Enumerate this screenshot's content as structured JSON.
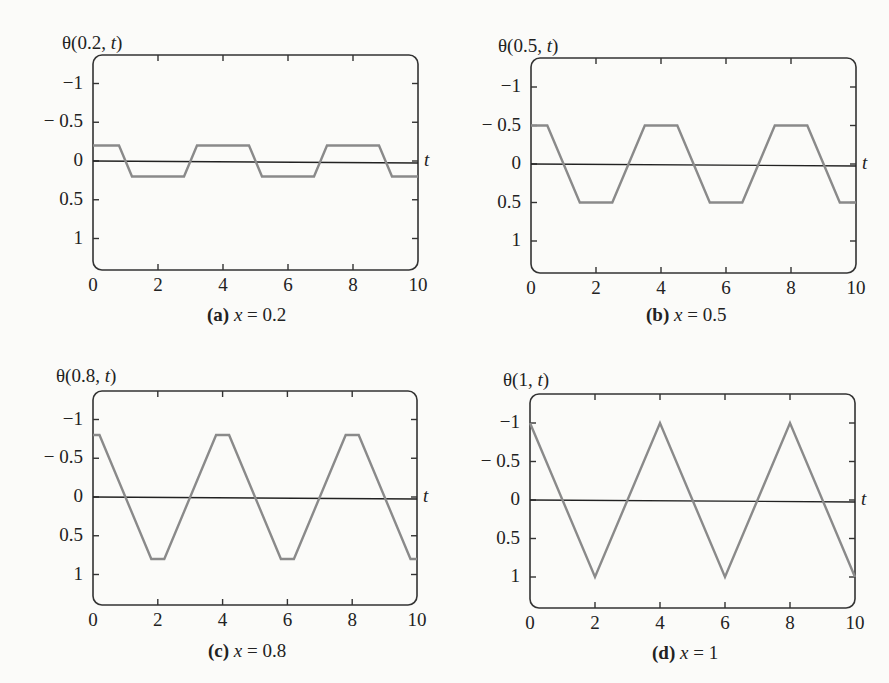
{
  "figure": {
    "panels": [
      {
        "id": "a",
        "ylabel_prefix": "θ(0.2, ",
        "ylabel_var": "t",
        "ylabel_suffix": ")",
        "caption_tag": "(a)",
        "caption_var": "x",
        "caption_eq": " = 0.2",
        "tvar": "t"
      },
      {
        "id": "b",
        "ylabel_prefix": "θ(0.5, ",
        "ylabel_var": "t",
        "ylabel_suffix": ")",
        "caption_tag": "(b)",
        "caption_var": "x",
        "caption_eq": " = 0.5",
        "tvar": "t"
      },
      {
        "id": "c",
        "ylabel_prefix": "θ(0.8, ",
        "ylabel_var": "t",
        "ylabel_suffix": ")",
        "caption_tag": "(c)",
        "caption_var": "x",
        "caption_eq": " = 0.8",
        "tvar": "t"
      },
      {
        "id": "d",
        "ylabel_prefix": "θ(1, ",
        "ylabel_var": "t",
        "ylabel_suffix": ")",
        "caption_tag": "(d)",
        "caption_var": "x",
        "caption_eq": " = 1",
        "tvar": "t"
      }
    ],
    "yticks": [
      "1",
      "0.5",
      "0",
      "− 0.5",
      "−1"
    ],
    "xticks": [
      "0",
      "2",
      "4",
      "6",
      "8",
      "10"
    ],
    "colors": {
      "curve": "#8a8a8a",
      "axis": "#222222",
      "frame": "#333333"
    }
  },
  "chart_data": [
    {
      "type": "line",
      "title": "(a) x = 0.2",
      "xlabel": "t",
      "ylabel": "θ(0.2, t)",
      "xlim": [
        0,
        10
      ],
      "ylim": [
        -1.3,
        1.3
      ],
      "xticks": [
        0,
        2,
        4,
        6,
        8,
        10
      ],
      "yticks": [
        -1,
        -0.5,
        0,
        0.5,
        1
      ],
      "grid": false,
      "x": [
        0,
        0.8,
        1.2,
        2.8,
        3.2,
        4.8,
        5.2,
        6.8,
        7.2,
        8.8,
        9.2,
        10
      ],
      "y": [
        0.2,
        0.2,
        -0.2,
        -0.2,
        0.2,
        0.2,
        -0.2,
        -0.2,
        0.2,
        0.2,
        -0.2,
        -0.2
      ]
    },
    {
      "type": "line",
      "title": "(b) x = 0.5",
      "xlabel": "t",
      "ylabel": "θ(0.5, t)",
      "xlim": [
        0,
        10
      ],
      "ylim": [
        -1.3,
        1.3
      ],
      "xticks": [
        0,
        2,
        4,
        6,
        8,
        10
      ],
      "yticks": [
        -1,
        -0.5,
        0,
        0.5,
        1
      ],
      "grid": false,
      "x": [
        0,
        0.5,
        1.5,
        2.5,
        3.5,
        4.5,
        5.5,
        6.5,
        7.5,
        8.5,
        9.5,
        10
      ],
      "y": [
        0.5,
        0.5,
        -0.5,
        -0.5,
        0.5,
        0.5,
        -0.5,
        -0.5,
        0.5,
        0.5,
        -0.5,
        -0.5
      ]
    },
    {
      "type": "line",
      "title": "(c) x = 0.8",
      "xlabel": "t",
      "ylabel": "θ(0.8, t)",
      "xlim": [
        0,
        10
      ],
      "ylim": [
        -1.3,
        1.3
      ],
      "xticks": [
        0,
        2,
        4,
        6,
        8,
        10
      ],
      "yticks": [
        -1,
        -0.5,
        0,
        0.5,
        1
      ],
      "grid": false,
      "x": [
        0,
        0.2,
        1.8,
        2.2,
        3.8,
        4.2,
        5.8,
        6.2,
        7.8,
        8.2,
        9.8,
        10
      ],
      "y": [
        0.8,
        0.8,
        -0.8,
        -0.8,
        0.8,
        0.8,
        -0.8,
        -0.8,
        0.8,
        0.8,
        -0.8,
        -0.8
      ]
    },
    {
      "type": "line",
      "title": "(d) x = 1",
      "xlabel": "t",
      "ylabel": "θ(1, t)",
      "xlim": [
        0,
        10
      ],
      "ylim": [
        -1.3,
        1.3
      ],
      "xticks": [
        0,
        2,
        4,
        6,
        8,
        10
      ],
      "yticks": [
        -1,
        -0.5,
        0,
        0.5,
        1
      ],
      "grid": false,
      "x": [
        0,
        2,
        4,
        6,
        8,
        10
      ],
      "y": [
        1,
        -1,
        1,
        -1,
        1,
        -1
      ]
    }
  ]
}
